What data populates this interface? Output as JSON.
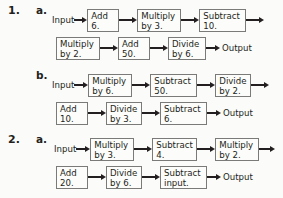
{
  "page": {
    "background_color": "#fbfbf9",
    "text_color": "#231f20",
    "box_border_color": "#7a7a78",
    "input_label": "Input",
    "output_label": "Output"
  },
  "problems": [
    {
      "number": "1.",
      "parts": [
        {
          "letter": "a.",
          "input_label": "Input",
          "output_label": "Output",
          "row1": [
            {
              "l1": "Add",
              "l2": "6."
            },
            {
              "l1": "Multiply",
              "l2": "by 3."
            },
            {
              "l1": "Subtract",
              "l2": "10."
            }
          ],
          "row2": [
            {
              "l1": "Multiply",
              "l2": "by 2."
            },
            {
              "l1": "Add",
              "l2": "50."
            },
            {
              "l1": "Divide",
              "l2": "by 6."
            }
          ]
        },
        {
          "letter": "b.",
          "input_label": "Input",
          "output_label": "Output",
          "row1": [
            {
              "l1": "Multiply",
              "l2": "by 6."
            },
            {
              "l1": "Subtract",
              "l2": "50."
            },
            {
              "l1": "Divide",
              "l2": "by 2."
            }
          ],
          "row2": [
            {
              "l1": "Add",
              "l2": "10."
            },
            {
              "l1": "Divide",
              "l2": "by 3."
            },
            {
              "l1": "Subtract",
              "l2": "6."
            }
          ]
        }
      ]
    },
    {
      "number": "2.",
      "parts": [
        {
          "letter": "a.",
          "input_label": "Input",
          "output_label": "Output",
          "row1": [
            {
              "l1": "Multiply",
              "l2": "by 3."
            },
            {
              "l1": "Subtract",
              "l2": "4."
            },
            {
              "l1": "Multiply",
              "l2": "by 2."
            }
          ],
          "row2": [
            {
              "l1": "Add",
              "l2": "20."
            },
            {
              "l1": "Divide",
              "l2": "by 6."
            },
            {
              "l1": "Subtract",
              "l2": "input."
            }
          ]
        }
      ]
    }
  ]
}
